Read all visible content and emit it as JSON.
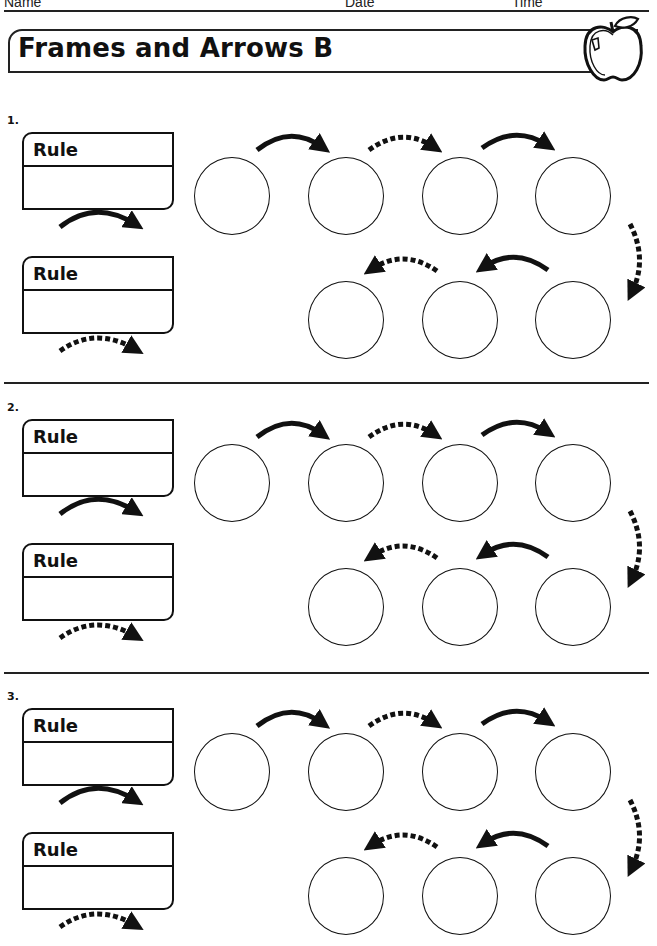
{
  "header": {
    "name_label": "Name",
    "date_label": "Date",
    "time_label": "Time"
  },
  "title": "Frames and Arrows B",
  "icons": {
    "logo": "apple-icon"
  },
  "problems": [
    {
      "number": "1.",
      "rule_top_label": "Rule",
      "rule_bottom_label": "Rule",
      "rule_top_arrow": "solid",
      "rule_bottom_arrow": "dashed",
      "top_row_frames": 4,
      "bottom_row_frames": 3
    },
    {
      "number": "2.",
      "rule_top_label": "Rule",
      "rule_bottom_label": "Rule",
      "rule_top_arrow": "solid",
      "rule_bottom_arrow": "dashed",
      "top_row_frames": 4,
      "bottom_row_frames": 3
    },
    {
      "number": "3.",
      "rule_top_label": "Rule",
      "rule_bottom_label": "Rule",
      "rule_top_arrow": "solid",
      "rule_bottom_arrow": "dashed",
      "top_row_frames": 4,
      "bottom_row_frames": 3
    }
  ],
  "arrow_sequence": {
    "top_row": [
      "solid",
      "dashed",
      "solid"
    ],
    "turn": "dashed",
    "bottom_row": [
      "solid",
      "dashed"
    ]
  },
  "colors": {
    "ink": "#111111",
    "paper": "#ffffff"
  }
}
